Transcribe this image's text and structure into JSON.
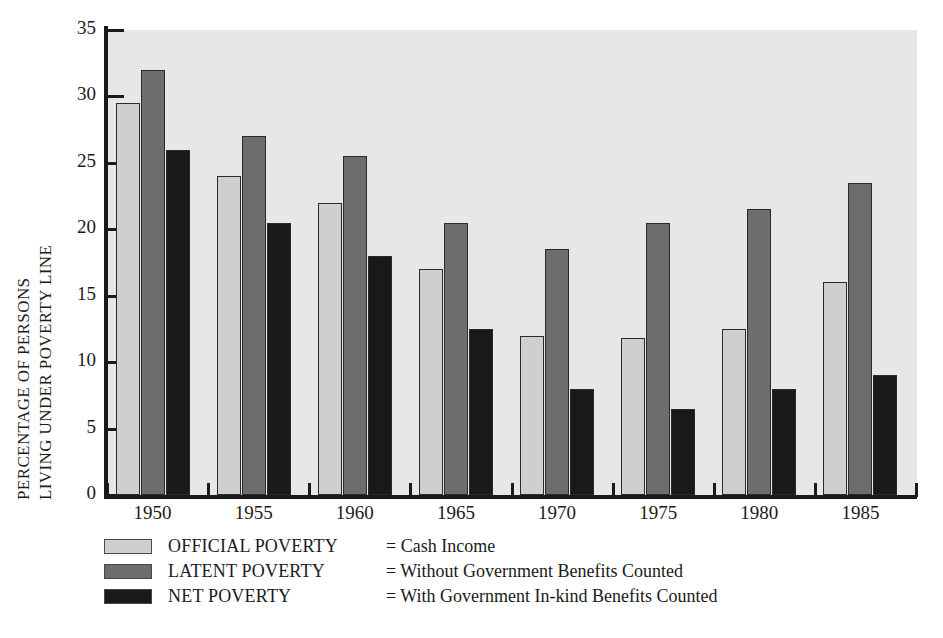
{
  "chart_data": {
    "type": "bar",
    "title": "",
    "subtitle": "",
    "xlabel": "",
    "ylabel": "PERCENTAGE OF PERSONS LIVING UNDER POVERTY LINE",
    "ylabel_lines": [
      "PERCENTAGE OF PERSONS",
      "LIVING UNDER POVERTY LINE"
    ],
    "categories": [
      "1950",
      "1955",
      "1960",
      "1965",
      "1970",
      "1975",
      "1980",
      "1985"
    ],
    "series": [
      {
        "name": "OFFICIAL POVERTY",
        "description": "Cash Income",
        "color": "#cfcfcf",
        "values": [
          29.5,
          24.0,
          22.0,
          17.0,
          12.0,
          11.8,
          12.5,
          16.0
        ]
      },
      {
        "name": "LATENT POVERTY",
        "description": "Without Government Benefits Counted",
        "color": "#6d6d6d",
        "values": [
          32.0,
          27.0,
          25.5,
          20.5,
          18.5,
          20.5,
          21.5,
          23.5
        ]
      },
      {
        "name": "NET POVERTY",
        "description": "With Government In-kind Benefits Counted",
        "color": "#191919",
        "values": [
          26.0,
          20.5,
          18.0,
          12.5,
          8.0,
          6.5,
          8.0,
          9.0
        ]
      }
    ],
    "ylim": [
      0,
      35
    ],
    "yticks": [
      0,
      5,
      10,
      15,
      20,
      25,
      30,
      35
    ],
    "ytick_labels": [
      "0",
      "5",
      "10",
      "15",
      "20",
      "25",
      "30",
      "35"
    ],
    "grid": false,
    "legend_position": "below-plot",
    "plot_background": "#e7e7e7",
    "axis_color": "#1a1a1a"
  },
  "legend": {
    "rows": [
      {
        "name": "OFFICIAL POVERTY",
        "equals": "= Cash Income"
      },
      {
        "name": "LATENT POVERTY",
        "equals": "= Without Government Benefits Counted"
      },
      {
        "name": "NET POVERTY",
        "equals": "= With Government In-kind Benefits Counted"
      }
    ]
  }
}
